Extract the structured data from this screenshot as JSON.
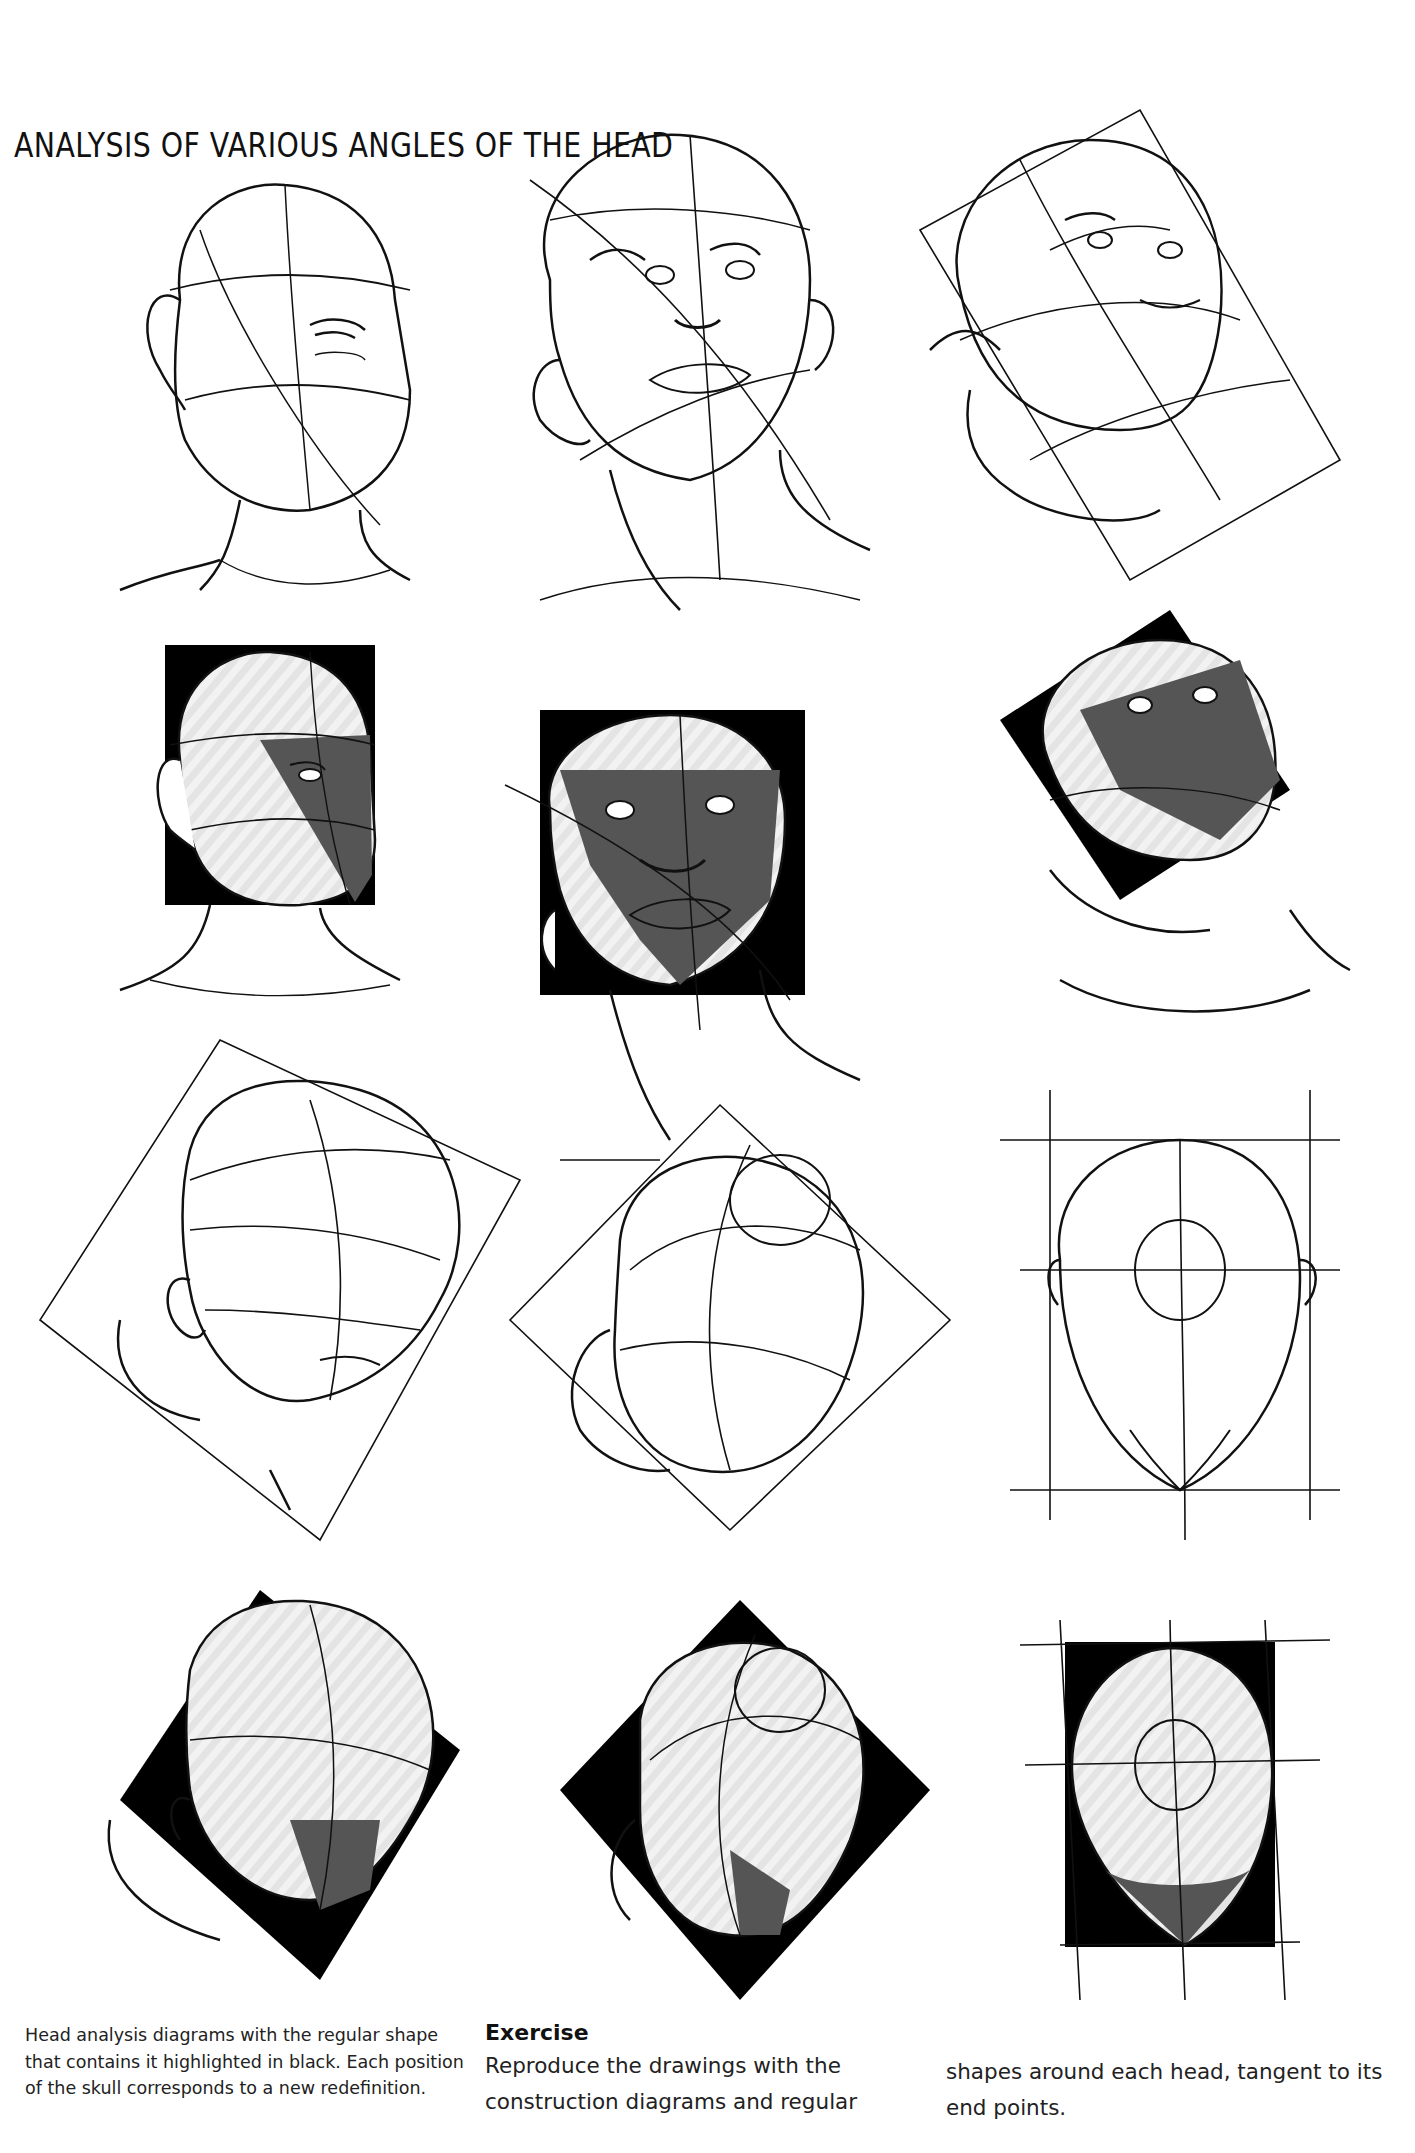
{
  "page": {
    "title": "ANALYSIS OF VARIOUS ANGLES OF THE HEAD",
    "background": "#ffffff",
    "ink_color": "#111111",
    "shadow_color": "#555555",
    "highlight_color": "#000000"
  },
  "figures": [
    {
      "row": 1,
      "col": 1,
      "view": "three-quarter front, slight turn",
      "style": "line construction"
    },
    {
      "row": 1,
      "col": 2,
      "view": "looking up from below",
      "style": "line construction"
    },
    {
      "row": 1,
      "col": 3,
      "view": "tilted back, three-quarter",
      "style": "line construction"
    },
    {
      "row": 2,
      "col": 1,
      "view": "three-quarter front, slight turn",
      "style": "black bounding rectangle highlighted"
    },
    {
      "row": 2,
      "col": 2,
      "view": "looking up from below",
      "style": "black bounding rectangle highlighted"
    },
    {
      "row": 2,
      "col": 3,
      "view": "tilted back, three-quarter",
      "style": "black rotated rectangle highlighted"
    },
    {
      "row": 3,
      "col": 1,
      "view": "tilted down, three-quarter",
      "style": "line construction"
    },
    {
      "row": 3,
      "col": 2,
      "view": "top of head, tilted",
      "style": "line construction"
    },
    {
      "row": 3,
      "col": 3,
      "view": "top of head, front-facing",
      "style": "line construction"
    },
    {
      "row": 4,
      "col": 1,
      "view": "tilted down, three-quarter",
      "style": "black rotated square highlighted"
    },
    {
      "row": 4,
      "col": 2,
      "view": "top of head, tilted",
      "style": "black rotated square highlighted"
    },
    {
      "row": 4,
      "col": 3,
      "view": "top of head, front-facing",
      "style": "black bounding rectangle highlighted"
    }
  ],
  "caption": {
    "text": "Head analysis diagrams with the regular shape that contains it highlighted in black. Each position of the skull corresponds to a new redefinition."
  },
  "exercise": {
    "title": "Exercise",
    "text_part1": "Reproduce the drawings with the construction diagrams and regular",
    "text_part2": "shapes around each head, tangent to its end points."
  }
}
